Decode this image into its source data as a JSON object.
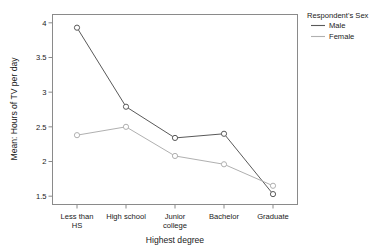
{
  "chart_data": {
    "type": "line",
    "title": "",
    "xlabel": "Highest degree",
    "ylabel": "Mean: Hours of TV per day",
    "categories": [
      "Less than HS",
      "High school",
      "Junior college",
      "Bachelor",
      "Graduate"
    ],
    "category_lines": [
      [
        "Less than",
        "HS"
      ],
      [
        "High school"
      ],
      [
        "Junior",
        "college"
      ],
      [
        "Bachelor"
      ],
      [
        "Graduate"
      ]
    ],
    "series": [
      {
        "name": "Male",
        "values": [
          3.93,
          2.79,
          2.34,
          2.4,
          1.53
        ],
        "color": "#595959"
      },
      {
        "name": "Female",
        "values": [
          2.38,
          2.5,
          2.08,
          1.96,
          1.65
        ],
        "color": "#b0b0b0"
      }
    ],
    "ylim": [
      1.38,
      4.12
    ],
    "yticks": [
      1.5,
      2,
      2.5,
      3,
      3.5,
      4
    ],
    "ytick_labels": [
      "1.5",
      "2",
      "2.5",
      "3",
      "3.5",
      "4"
    ],
    "grid": false,
    "legend_position": "right",
    "marker": "open-circle"
  },
  "legend": {
    "title": "Respondent's Sex",
    "entries": [
      {
        "label": "Male",
        "color": "#595959"
      },
      {
        "label": "Female",
        "color": "#b0b0b0"
      }
    ]
  },
  "artifacts": {
    "top_clipped_text": ""
  }
}
